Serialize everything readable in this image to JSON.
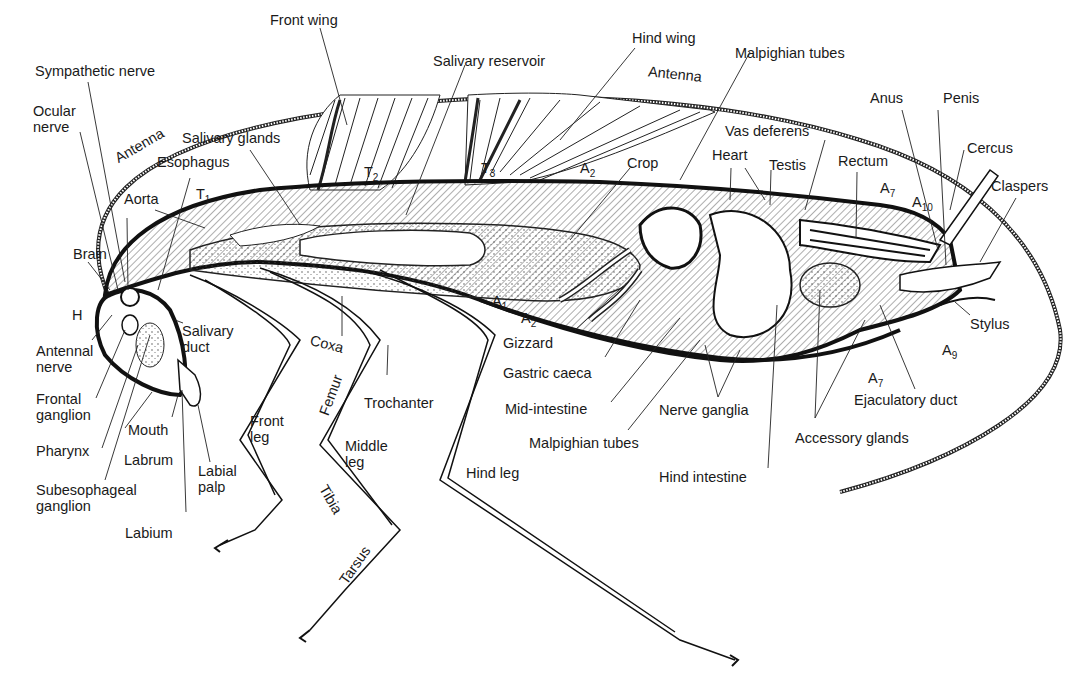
{
  "diagram": {
    "labels": {
      "front_wing": "Front wing",
      "hind_wing": "Hind wing",
      "salivary_reservoir": "Salivary reservoir",
      "malpighian_tubes_top": "Malpighian tubes",
      "sympathetic_nerve": "Sympathetic nerve",
      "ocular_nerve_1": "Ocular",
      "ocular_nerve_2": "nerve",
      "antenna_left": "Antenna",
      "antenna_right": "Antenna",
      "salivary_glands": "Salivary glands",
      "esophagus": "Esophagus",
      "aorta": "Aorta",
      "t1": "T",
      "t1_sub": "1",
      "t2": "T",
      "t2_sub": "2",
      "t3": "T",
      "t3_sub": "3",
      "a2_top": "A",
      "a2_top_sub": "2",
      "crop": "Crop",
      "heart": "Heart",
      "testis": "Testis",
      "vas_deferens": "Vas deferens",
      "rectum": "Rectum",
      "anus": "Anus",
      "penis": "Penis",
      "cercus": "Cercus",
      "claspers": "Claspers",
      "a7_top": "A",
      "a7_top_sub": "7",
      "a10": "A",
      "a10_sub": "10",
      "brain": "Brain",
      "h": "H",
      "antennal_nerve_1": "Antennal",
      "antennal_nerve_2": "nerve",
      "salivary_duct_1": "Salivary",
      "salivary_duct_2": "duct",
      "frontal_ganglion_1": "Frontal",
      "frontal_ganglion_2": "ganglion",
      "pharynx": "Pharynx",
      "mouth": "Mouth",
      "labrum": "Labrum",
      "labial_palp_1": "Labial",
      "labial_palp_2": "palp",
      "subesophageal_1": "Subesophageal",
      "subesophageal_2": "ganglion",
      "labium": "Labium",
      "coxa": "Coxa",
      "femur": "Femur",
      "trochanter": "Trochanter",
      "front_leg_1": "Front",
      "front_leg_2": "leg",
      "middle_leg_1": "Middle",
      "middle_leg_2": "leg",
      "tibia": "Tibia",
      "tarsus": "Tarsus",
      "hind_leg": "Hind leg",
      "a1": "A",
      "a1_sub": "1",
      "a2_bottom": "A",
      "a2_bottom_sub": "2",
      "gizzard": "Gizzard",
      "gastric_caeca": "Gastric caeca",
      "mid_intestine": "Mid-intestine",
      "malpighian_tubes_bottom": "Malpighian tubes",
      "nerve_ganglia": "Nerve ganglia",
      "hind_intestine": "Hind intestine",
      "accessory_glands": "Accessory glands",
      "ejaculatory_duct": "Ejaculatory duct",
      "stylus": "Stylus",
      "a9": "A",
      "a9_sub": "9",
      "a7_bottom": "A",
      "a7_bottom_sub": "7"
    }
  }
}
